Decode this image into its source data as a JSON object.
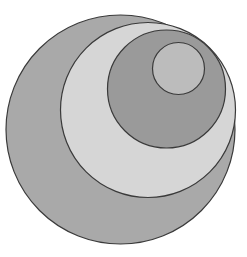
{
  "figure": {
    "background_color": "#ffffff",
    "canvas": {
      "width": 247,
      "height": 257
    },
    "stroke_color": "#3a3a3a",
    "stroke_width": 1.2,
    "shape_count": 4,
    "shapes": [
      {
        "name": "outer-circle",
        "label": "Circle 1 (outermost)",
        "cx": 120.5,
        "cy": 129.5,
        "r": 114.5,
        "fill": "#a9a9a9",
        "order": 1
      },
      {
        "name": "second-circle",
        "label": "Circle 2",
        "cx": 148.0,
        "cy": 110.0,
        "r": 87.5,
        "fill": "#d6d6d6",
        "order": 2
      },
      {
        "name": "third-circle",
        "label": "Circle 3",
        "cx": 166.5,
        "cy": 89.0,
        "r": 59.0,
        "fill": "#9a9a9a",
        "order": 3
      },
      {
        "name": "inner-circle",
        "label": "Circle 4 (innermost)",
        "cx": 178.5,
        "cy": 68.5,
        "r": 26.0,
        "fill": "#bcbcbc",
        "order": 4
      }
    ]
  }
}
